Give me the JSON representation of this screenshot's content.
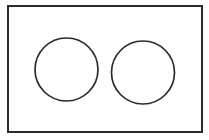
{
  "canvas": {
    "width": 209,
    "height": 140,
    "background_color": "#ffffff",
    "title": "Two circles inside a rectangle"
  },
  "style": {
    "stroke_color": "#2b2b2b",
    "rectangle_stroke_width": 2,
    "circle_stroke_width": 1.7,
    "fill": "none"
  },
  "shapes": {
    "rectangle": {
      "name": "outer-rectangle",
      "x": 8,
      "y": 6,
      "width": 194,
      "height": 126
    },
    "circles": [
      {
        "name": "left-circle",
        "cx": 66.5,
        "cy": 69.5,
        "r": 31.5
      },
      {
        "name": "right-circle",
        "cx": 143,
        "cy": 72.5,
        "r": 31.5
      }
    ]
  }
}
